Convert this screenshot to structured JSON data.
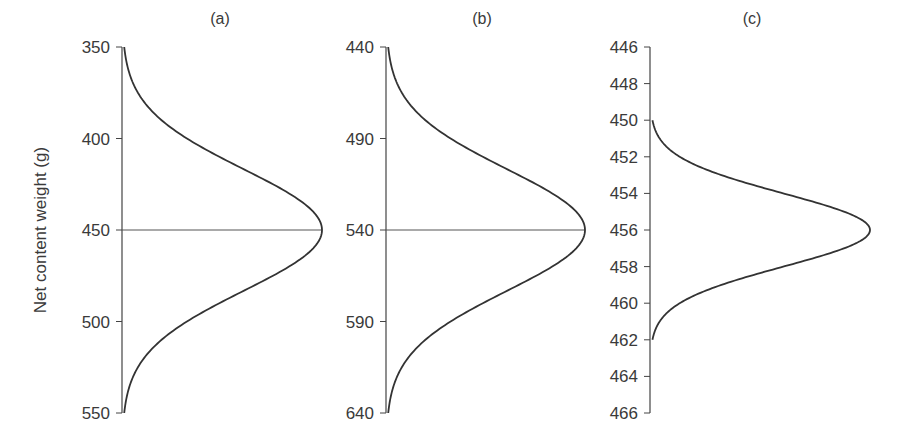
{
  "figure": {
    "ylabel": "Net content weight (g)"
  },
  "panels": [
    {
      "label": "(a)",
      "ticks": [
        "350",
        "400",
        "450",
        "500",
        "550"
      ]
    },
    {
      "label": "(b)",
      "ticks": [
        "440",
        "490",
        "540",
        "590",
        "640"
      ]
    },
    {
      "label": "(c)",
      "ticks": [
        "446",
        "448",
        "450",
        "452",
        "454",
        "456",
        "458",
        "460",
        "462",
        "464",
        "466"
      ]
    }
  ],
  "chart_data": [
    {
      "type": "line",
      "title": "(a)",
      "orientation": "vertical-distribution",
      "ylabel": "Net content weight (g)",
      "ylim": [
        350,
        550
      ],
      "yticks": [
        350,
        400,
        450,
        500,
        550
      ],
      "distribution": "normal",
      "mean": 450,
      "support": [
        350,
        550
      ],
      "reference_line": 450,
      "grid": false
    },
    {
      "type": "line",
      "title": "(b)",
      "orientation": "vertical-distribution",
      "ylabel": "Net content weight (g)",
      "ylim": [
        440,
        640
      ],
      "yticks": [
        440,
        490,
        540,
        590,
        640
      ],
      "distribution": "normal",
      "mean": 540,
      "support": [
        440,
        640
      ],
      "reference_line": 540,
      "grid": false
    },
    {
      "type": "line",
      "title": "(c)",
      "orientation": "vertical-distribution",
      "ylabel": "Net content weight (g)",
      "ylim": [
        446,
        466
      ],
      "yticks": [
        446,
        448,
        450,
        452,
        454,
        456,
        458,
        460,
        462,
        464,
        466
      ],
      "distribution": "normal",
      "mean": 456,
      "support": [
        450,
        462
      ],
      "grid": false
    }
  ]
}
